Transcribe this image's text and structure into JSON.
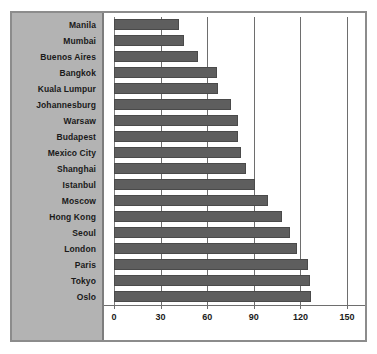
{
  "chart_data": {
    "type": "bar",
    "orientation": "horizontal",
    "title": "",
    "subtitle": "",
    "xlabel": "",
    "ylabel": "",
    "xlim": [
      0,
      150
    ],
    "xticks": [
      0,
      30,
      60,
      90,
      120,
      150
    ],
    "xtick_labels": [
      "0",
      "30",
      "60",
      "90",
      "120",
      "150"
    ],
    "grid": true,
    "legend": null,
    "categories": [
      "Manila",
      "Mumbai",
      "Buenos Aires",
      "Bangkok",
      "Kuala Lumpur",
      "Johannesburg",
      "Warsaw",
      "Budapest",
      "Mexico City",
      "Shanghai",
      "Istanbul",
      "Moscow",
      "Hong Kong",
      "Seoul",
      "London",
      "Paris",
      "Tokyo",
      "Oslo"
    ],
    "values": [
      42,
      45,
      54,
      66,
      67,
      75,
      80,
      80,
      82,
      85,
      91,
      99,
      108,
      113,
      118,
      125,
      126,
      127
    ],
    "bar_color": "#5e5e5e",
    "bar_edge_color": "#4a4a4a",
    "panel_color": "#b3b3b3",
    "plot_background": "#ffffff",
    "frame_color": "#8c8c8c",
    "gridline_color": "#6e6e6e"
  }
}
